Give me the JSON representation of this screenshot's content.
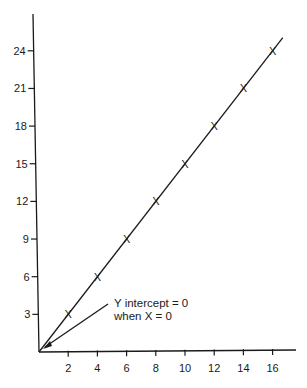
{
  "chart_data": {
    "type": "line",
    "title": "",
    "xlabel": "",
    "ylabel": "",
    "x": [
      2,
      4,
      6,
      8,
      10,
      12,
      14,
      16
    ],
    "series": [
      {
        "name": "y = 1.5x",
        "values": [
          3,
          6,
          9,
          12,
          15,
          18,
          21,
          24
        ],
        "marker": "X"
      }
    ],
    "x_ticks": [
      "2",
      "4",
      "6",
      "8",
      "10",
      "12",
      "14",
      "16"
    ],
    "y_ticks": [
      "3",
      "6",
      "9",
      "12",
      "15",
      "18",
      "21",
      "24"
    ],
    "xlim": [
      0,
      17.5
    ],
    "ylim": [
      0,
      27
    ],
    "grid": false,
    "legend": "none",
    "annotations": [
      {
        "text_line1": "Y intercept = 0",
        "text_line2": "when X = 0",
        "points_to": [
          0,
          0
        ]
      }
    ]
  },
  "labels": {
    "x_ticks": [
      "2",
      "4",
      "6",
      "8",
      "10",
      "12",
      "14",
      "16"
    ],
    "y_ticks": [
      "3",
      "6",
      "9",
      "12",
      "15",
      "18",
      "21",
      "24"
    ],
    "marker_glyph": "X",
    "annotation_line1": "Y intercept = 0",
    "annotation_line2": "when X = 0"
  }
}
